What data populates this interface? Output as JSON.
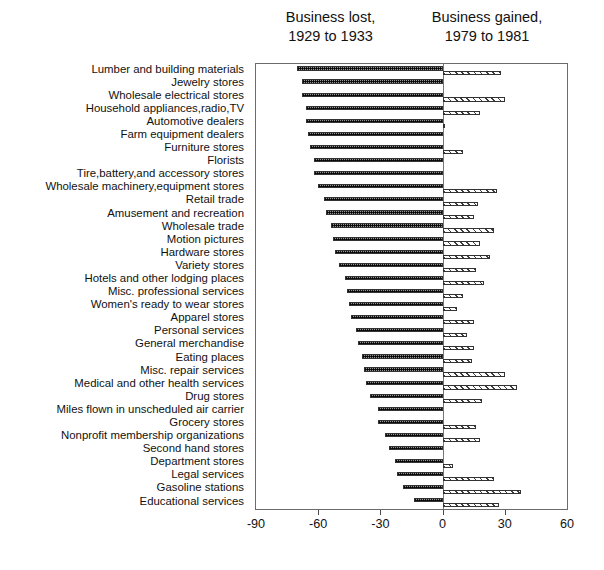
{
  "headers": {
    "lost": {
      "line1": "Business lost,",
      "line2": "1929 to 1933"
    },
    "gained": {
      "line1": "Business gained,",
      "line2": "1979 to 1981"
    }
  },
  "axis": {
    "ticks": [
      -90,
      -60,
      -30,
      0,
      30,
      60
    ],
    "tick_labels": [
      "-90",
      "-60",
      "-30",
      "0",
      "30",
      "60"
    ]
  },
  "chart_data": {
    "type": "bar",
    "orientation": "horizontal",
    "title": "",
    "subtitle": "",
    "xlabel": "",
    "ylabel": "",
    "xlim": [
      -90,
      60
    ],
    "grid": false,
    "legend_position": "top",
    "categories": [
      "Lumber and building materials",
      "Jewelry stores",
      "Wholesale electrical stores",
      "Household appliances,radio,TV",
      "Automotive dealers",
      "Farm equipment dealers",
      "Furniture stores",
      "Florists",
      "Tire,battery,and accessory stores",
      "Wholesale machinery,equipment stores",
      "Retail trade",
      "Amusement and recreation",
      "Wholesale trade",
      "Motion pictures",
      "Hardware stores",
      "Variety stores",
      "Hotels and other lodging places",
      "Misc. professional services",
      "Women's ready to wear stores",
      "Apparel stores",
      "Personal services",
      "General merchandise",
      "Eating places",
      "Misc. repair services",
      "Medical and other health services",
      "Drug stores",
      "Miles flown in unscheduled air carrier",
      "Grocery stores",
      "Nonprofit membership organizations",
      "Second hand stores",
      "Department stores",
      "Legal services",
      "Gasoline stations",
      "Educational services"
    ],
    "series": [
      {
        "name": "Business lost, 1929 to 1933",
        "values": [
          -70,
          -68,
          -68,
          -66,
          -66,
          -65,
          -64,
          -62,
          -62,
          -60,
          -57,
          -56,
          -54,
          -53,
          -52,
          -50,
          -47,
          -46,
          -45,
          -44,
          -42,
          -41,
          -39,
          -38,
          -37,
          -35,
          -31,
          -31,
          -28,
          -26,
          -23,
          -22,
          -19,
          -14
        ]
      },
      {
        "name": "Business gained, 1979 to 1981",
        "values": [
          28,
          0,
          30,
          18,
          1,
          0,
          10,
          0,
          0,
          26,
          17,
          15,
          25,
          18,
          23,
          16,
          20,
          10,
          7,
          15,
          12,
          15,
          14,
          30,
          36,
          19,
          0,
          16,
          18,
          0,
          5,
          25,
          38,
          27
        ]
      }
    ]
  }
}
